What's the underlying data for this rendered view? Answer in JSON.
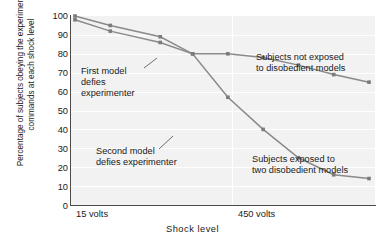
{
  "chart_data": {
    "type": "line",
    "title": "",
    "xlabel": "Shock level",
    "ylabel": "Percentage of subjects obeying the experimenter's commands at each shock level",
    "ylim": [
      0,
      100
    ],
    "yticks": [
      100,
      90,
      80,
      70,
      60,
      50,
      40,
      30,
      20,
      10,
      0
    ],
    "xticks": [
      "15 volts",
      "450 volts"
    ],
    "grid": "horizontal-white-lines",
    "legend": "inline-annotations",
    "series": [
      {
        "name": "Subjects not exposed to disobedient models",
        "color": "#8a8a8a",
        "x": [
          0,
          12,
          29,
          40,
          52,
          64,
          76,
          88,
          100
        ],
        "values": [
          100,
          95,
          89,
          80,
          80,
          78,
          74,
          69,
          65
        ]
      },
      {
        "name": "Subjects exposed to two disobedient models",
        "color": "#8a8a8a",
        "x": [
          0,
          12,
          29,
          40,
          52,
          64,
          76,
          88,
          100
        ],
        "values": [
          98,
          92,
          86,
          80,
          57,
          40,
          25,
          16,
          14
        ]
      }
    ],
    "annotations": [
      {
        "id": "first-model",
        "text": "First model\ndefies\nexperimenter",
        "points_to": "crossing point at 80%"
      },
      {
        "id": "second-model",
        "text": "Second model\ndefies experimenter",
        "points_to": "lower series at 40%"
      },
      {
        "id": "not-exposed",
        "text": "Subjects not exposed\nto disobedient models",
        "points_to": "upper series"
      },
      {
        "id": "exposed",
        "text": "Subjects exposed to\ntwo disobedient models",
        "points_to": "lower series"
      }
    ]
  },
  "axis": {
    "y_tick_100": "100",
    "y_tick_90": "90",
    "y_tick_80": "80",
    "y_tick_70": "70",
    "y_tick_60": "60",
    "y_tick_50": "50",
    "y_tick_40": "40",
    "y_tick_30": "30",
    "y_tick_20": "20",
    "y_tick_10": "10",
    "y_tick_0": "0",
    "y_axis_title": "Percentage of subjects obeying the experimenter's commands at each shock level",
    "x_axis_title": "Shock level",
    "x_tick_left": "15 volts",
    "x_tick_right": "450 volts"
  },
  "annotations": {
    "first_model": "First model\ndefies\nexperimenter",
    "second_model": "Second model\ndefies experimenter",
    "not_exposed": "Subjects not exposed\nto disobedient models",
    "exposed": "Subjects exposed to\ntwo disobedient models"
  }
}
